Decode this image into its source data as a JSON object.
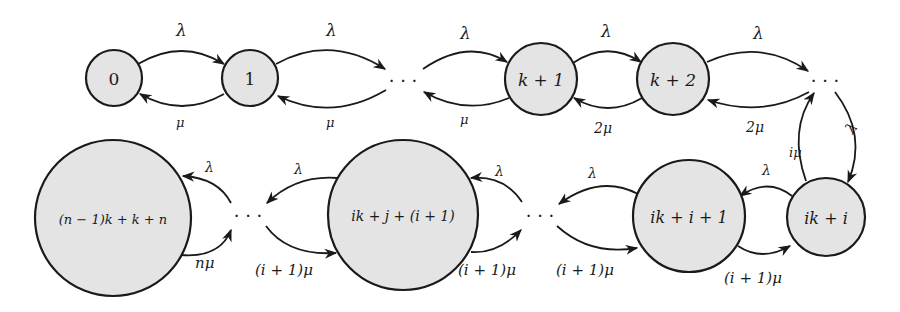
{
  "diagram": {
    "type": "state-transition-diagram",
    "nodes": [
      {
        "id": "n0",
        "label": "0"
      },
      {
        "id": "n1",
        "label": "1"
      },
      {
        "id": "d1",
        "label": "···"
      },
      {
        "id": "nk1",
        "label": "k + 1"
      },
      {
        "id": "nk2",
        "label": "k + 2"
      },
      {
        "id": "d2",
        "label": "···"
      },
      {
        "id": "nik_i",
        "label": "ik + i"
      },
      {
        "id": "nik_i1",
        "label": "ik + i + 1"
      },
      {
        "id": "d3",
        "label": "···"
      },
      {
        "id": "nikj",
        "label": "ik + j + (i + 1)"
      },
      {
        "id": "d4",
        "label": "···"
      },
      {
        "id": "nlast",
        "label": "(n − 1)k + k + n"
      }
    ],
    "edges": [
      {
        "from": "n0",
        "to": "n1",
        "label": "λ"
      },
      {
        "from": "n1",
        "to": "n0",
        "label": "μ"
      },
      {
        "from": "n1",
        "to": "d1",
        "label": "λ"
      },
      {
        "from": "d1",
        "to": "n1",
        "label": "μ"
      },
      {
        "from": "d1",
        "to": "nk1",
        "label": "λ"
      },
      {
        "from": "nk1",
        "to": "d1",
        "label": "μ"
      },
      {
        "from": "nk1",
        "to": "nk2",
        "label": "λ"
      },
      {
        "from": "nk2",
        "to": "nk1",
        "label": "2μ"
      },
      {
        "from": "nk2",
        "to": "d2",
        "label": "λ"
      },
      {
        "from": "d2",
        "to": "nk2",
        "label": "2μ"
      },
      {
        "from": "d2",
        "to": "nik_i",
        "label": "λ"
      },
      {
        "from": "nik_i",
        "to": "d2",
        "label": "iμ"
      },
      {
        "from": "nik_i",
        "to": "nik_i1",
        "label": "λ"
      },
      {
        "from": "nik_i1",
        "to": "nik_i",
        "label": "(i + 1)μ"
      },
      {
        "from": "nik_i1",
        "to": "d3",
        "label": "λ"
      },
      {
        "from": "d3",
        "to": "nik_i1",
        "label": "(i + 1)μ"
      },
      {
        "from": "nikj",
        "to": "d4",
        "label": "λ"
      },
      {
        "from": "d4",
        "to": "nikj",
        "label": "(i + 1)μ"
      },
      {
        "from": "d3",
        "to": "nikj",
        "label": "(i + 1)μ"
      },
      {
        "from": "d4",
        "to": "nlast",
        "label": "λ"
      },
      {
        "from": "nlast",
        "to": "d4",
        "label": "nμ"
      }
    ]
  },
  "labels": {
    "n0": "0",
    "n1": "1",
    "nk1": "k + 1",
    "nk2": "k + 2",
    "nik_i": "ik + i",
    "nik_i1": "ik + i + 1",
    "nikj": "ik + j + (i + 1)",
    "nlast": "(n − 1)k + k + n",
    "dots": "· · ·",
    "lambda": "λ",
    "mu": "μ",
    "two_mu": "2μ",
    "i_mu": "iμ",
    "i1_mu": "(i + 1)μ",
    "n_mu": "nμ"
  },
  "colors": {
    "node_fill": "#e4e4e4",
    "stroke": "#1a1a1a",
    "background": "#ffffff"
  }
}
